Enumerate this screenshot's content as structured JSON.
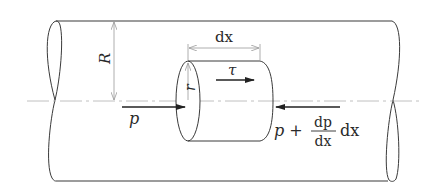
{
  "diagram": {
    "type": "pipe flow fluid element free-body diagram",
    "colors": {
      "line": "#3a3a3a",
      "dimension": "#9a9a9a",
      "centerline": "#b0b0b0",
      "arrow": "#222222",
      "background": "#ffffff"
    },
    "labels": {
      "pipe_radius": "R",
      "element_radius": "r",
      "element_length": "dx",
      "shear_stress": "τ",
      "upstream_pressure": "p",
      "downstream_pressure_prefix": "p +",
      "fraction_numerator": "dp",
      "fraction_denominator": "dx",
      "downstream_pressure_suffix": "dx"
    }
  }
}
